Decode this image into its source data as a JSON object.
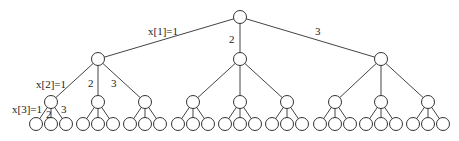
{
  "diagram": {
    "type": "tree",
    "branching": 3,
    "levels": 4,
    "root": {
      "x": 240,
      "y": 17
    },
    "level1": {
      "y": 59,
      "xs": [
        98,
        240,
        381
      ]
    },
    "level2": {
      "y": 102,
      "xs": [
        51,
        98,
        145,
        193,
        240,
        287,
        335,
        381,
        428
      ]
    },
    "leaf_offsets": [
      -15,
      0,
      15
    ],
    "leaf_y": 124,
    "node_radius": 6.5
  },
  "labels": {
    "edge_root_1": "x[1]=1",
    "edge_root_2": "2",
    "edge_root_3": "3",
    "edge_l1_1": "x[2]=1",
    "edge_l1_2": "2",
    "edge_l1_3": "3",
    "edge_l2_1": "x[3]=1",
    "edge_l2_2": "2",
    "edge_l2_3": "3"
  }
}
